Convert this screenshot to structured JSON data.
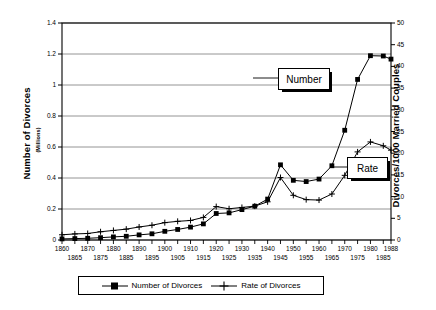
{
  "chart_data": {
    "type": "line",
    "title": "",
    "xlabel": "",
    "ylabel": "Number of Divorces",
    "ylabel_sub": "(Millions)",
    "ylabel_right": "Divorces/1000 Married Couples",
    "ylim": [
      0,
      1.4
    ],
    "ytick_step": 0.2,
    "ylim_right": [
      0,
      50
    ],
    "ytick_step_right": 5,
    "xlim": [
      1860,
      1988
    ],
    "grid": true,
    "legend_position": "bottom",
    "yticks_left": [
      "0",
      "0.2",
      "0.4",
      "0.6",
      "0.8",
      "1",
      "1.2",
      "1.4"
    ],
    "yticks_right": [
      "0",
      "5",
      "10",
      "15",
      "20",
      "25",
      "30",
      "35",
      "40",
      "45",
      "50"
    ],
    "x": [
      1860,
      1865,
      1870,
      1875,
      1880,
      1885,
      1890,
      1895,
      1900,
      1905,
      1910,
      1915,
      1920,
      1925,
      1930,
      1935,
      1940,
      1945,
      1950,
      1955,
      1960,
      1965,
      1970,
      1975,
      1980,
      1985,
      1988
    ],
    "xticks_row1": [
      "1860",
      "1870",
      "1880",
      "1890",
      "1900",
      "1910",
      "1920",
      "1930",
      "1940",
      "1950",
      "1960",
      "1970",
      "1980",
      "1988"
    ],
    "xticks_row2": [
      "1865",
      "1875",
      "1885",
      "1895",
      "1905",
      "1915",
      "1925",
      "1935",
      "1945",
      "1955",
      "1965",
      "1975",
      "1985"
    ],
    "series": [
      {
        "name": "Number of Divorces",
        "axis": "left",
        "marker": "square",
        "units": "millions",
        "values": [
          0.007,
          0.009,
          0.011,
          0.015,
          0.02,
          0.024,
          0.033,
          0.04,
          0.056,
          0.068,
          0.083,
          0.104,
          0.171,
          0.175,
          0.196,
          0.218,
          0.264,
          0.485,
          0.385,
          0.377,
          0.393,
          0.479,
          0.708,
          1.036,
          1.189,
          1.187,
          1.167
        ]
      },
      {
        "name": "Rate of Divorces",
        "axis": "right",
        "marker": "plus",
        "units": "divorces per 1000 married couples",
        "values": [
          1.2,
          1.4,
          1.5,
          1.9,
          2.2,
          2.5,
          3.0,
          3.4,
          4.0,
          4.3,
          4.5,
          5.2,
          7.7,
          7.2,
          7.5,
          7.8,
          8.8,
          14.4,
          10.3,
          9.3,
          9.2,
          10.6,
          14.9,
          20.3,
          22.6,
          21.7,
          20.7
        ]
      }
    ],
    "annotations": [
      {
        "label": "Number",
        "points_to_series": "Number of Divorces"
      },
      {
        "label": "Rate",
        "points_to_series": "Rate of Divorces"
      }
    ],
    "legend": [
      {
        "label": "Number of Divorces",
        "marker": "square"
      },
      {
        "label": "Rate of Divorces",
        "marker": "plus"
      }
    ]
  }
}
